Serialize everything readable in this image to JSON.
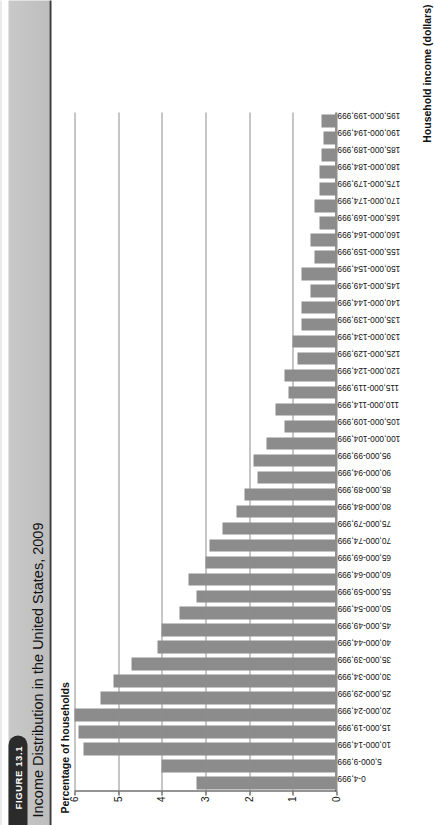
{
  "figure": {
    "badge_label": "FIGURE 13.1",
    "title": "Income Distribution in the United States, 2009"
  },
  "chart_data": {
    "type": "bar",
    "orientation": "vertical",
    "title": "Income Distribution in the United States, 2009",
    "xlabel": "Household income (dollars)",
    "ylabel": "Percentage of households",
    "ylim": [
      0,
      6
    ],
    "yticks": [
      0,
      1,
      2,
      3,
      4,
      5,
      6
    ],
    "ytick_labels": [
      "0",
      "1",
      "2",
      "3",
      "4",
      "5",
      "6"
    ],
    "grid": true,
    "legend": false,
    "bar_color": "#8c8c8c",
    "categories": [
      "0-4,999",
      "5,000-9,999",
      "10,000-14,999",
      "15,000-19,999",
      "20,000-24,999",
      "25,000-29,999",
      "30,000-34,999",
      "35,000-39,999",
      "40,000-44,999",
      "45,000-49,999",
      "50,000-54,999",
      "55,000-59,999",
      "60,000-64,999",
      "65,000-69,999",
      "70,000-74,999",
      "75,000-79,999",
      "80,000-84,999",
      "85,000-89,999",
      "90,000-94,999",
      "95,000-99,999",
      "100,000-104,999",
      "105,000-109,999",
      "110,000-114,999",
      "115,000-119,999",
      "120,000-124,999",
      "125,000-129,999",
      "130,000-134,999",
      "135,000-139,999",
      "140,000-144,999",
      "145,000-149,999",
      "150,000-154,999",
      "155,000-159,999",
      "160,000-164,999",
      "165,000-169,999",
      "170,000-174,999",
      "175,000-179,999",
      "180,000-184,999",
      "185,000-189,999",
      "190,000-194,999",
      "195,000-199,999"
    ],
    "values": [
      3.2,
      4.0,
      5.8,
      5.9,
      6.0,
      5.4,
      5.1,
      4.7,
      4.1,
      4.0,
      3.6,
      3.2,
      3.4,
      3.0,
      2.9,
      2.6,
      2.3,
      2.1,
      1.8,
      1.9,
      1.6,
      1.2,
      1.4,
      1.1,
      1.2,
      0.9,
      1.0,
      0.8,
      0.8,
      0.6,
      0.8,
      0.5,
      0.6,
      0.4,
      0.5,
      0.4,
      0.4,
      0.35,
      0.3,
      0.35
    ],
    "value_unit": "percent"
  }
}
